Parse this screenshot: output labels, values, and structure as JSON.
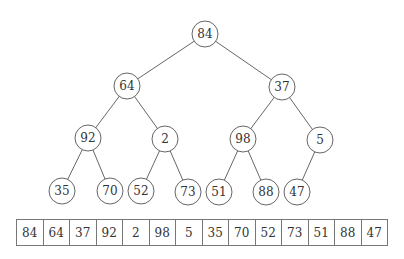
{
  "tree": {
    "radius": 13,
    "nodes": [
      {
        "id": 0,
        "value": "84",
        "x": 205,
        "y": 34
      },
      {
        "id": 1,
        "value": "64",
        "x": 127,
        "y": 86
      },
      {
        "id": 2,
        "value": "37",
        "x": 282,
        "y": 87
      },
      {
        "id": 3,
        "value": "92",
        "x": 88,
        "y": 138
      },
      {
        "id": 4,
        "value": "2",
        "x": 165,
        "y": 139
      },
      {
        "id": 5,
        "value": "98",
        "x": 243,
        "y": 139
      },
      {
        "id": 6,
        "value": "5",
        "x": 320,
        "y": 140
      },
      {
        "id": 7,
        "value": "35",
        "x": 62,
        "y": 191
      },
      {
        "id": 8,
        "value": "70",
        "x": 110,
        "y": 191
      },
      {
        "id": 9,
        "value": "52",
        "x": 141,
        "y": 191
      },
      {
        "id": 10,
        "value": "73",
        "x": 188,
        "y": 192
      },
      {
        "id": 11,
        "value": "51",
        "x": 219,
        "y": 192
      },
      {
        "id": 12,
        "value": "88",
        "x": 266,
        "y": 192
      },
      {
        "id": 13,
        "value": "47",
        "x": 297,
        "y": 192
      }
    ],
    "edges": [
      [
        0,
        1
      ],
      [
        0,
        2
      ],
      [
        1,
        3
      ],
      [
        1,
        4
      ],
      [
        2,
        5
      ],
      [
        2,
        6
      ],
      [
        3,
        7
      ],
      [
        3,
        8
      ],
      [
        4,
        9
      ],
      [
        4,
        10
      ],
      [
        5,
        11
      ],
      [
        5,
        12
      ],
      [
        6,
        13
      ]
    ]
  },
  "array": {
    "cells": [
      "84",
      "64",
      "37",
      "92",
      "2",
      "98",
      "5",
      "35",
      "70",
      "52",
      "73",
      "51",
      "88",
      "47"
    ]
  }
}
